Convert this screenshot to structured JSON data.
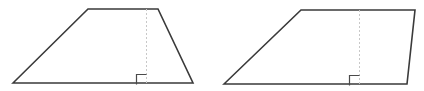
{
  "diagram": {
    "width": 424,
    "height": 91,
    "background": "#ffffff",
    "stroke_color": "#3a3a3a",
    "stroke_width": 1.6,
    "height_line_color": "#c8c8c8",
    "height_line_dash": "2,2",
    "height_line_width": 1,
    "right_angle_color": "#4a4a4a",
    "right_angle_width": 1.2,
    "figures": [
      {
        "id": "trapezoid-left",
        "type": "trapezoid",
        "vertices": [
          [
            13,
            83
          ],
          [
            88,
            9
          ],
          [
            158,
            9
          ],
          [
            193,
            83
          ]
        ],
        "height_line": {
          "x": 146,
          "y1": 9,
          "y2": 83
        },
        "right_angle_marker": {
          "x": 136,
          "y": 74,
          "size": 10
        }
      },
      {
        "id": "trapezoid-right",
        "type": "trapezoid",
        "vertices": [
          [
            224,
            84
          ],
          [
            301,
            10
          ],
          [
            415,
            10
          ],
          [
            407,
            84
          ]
        ],
        "height_line": {
          "x": 359,
          "y1": 10,
          "y2": 84
        },
        "right_angle_marker": {
          "x": 349,
          "y": 75,
          "size": 10
        }
      }
    ]
  }
}
